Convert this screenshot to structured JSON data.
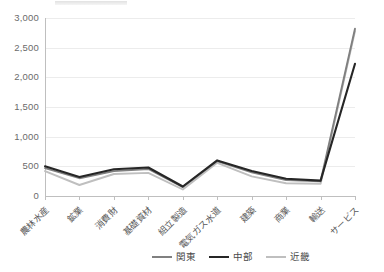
{
  "chart_data": {
    "type": "line",
    "title": "",
    "xlabel": "",
    "ylabel": "",
    "ylim": [
      0,
      3000
    ],
    "ytick_labels": [
      "3,000",
      "2,500",
      "2,000",
      "1,500",
      "1,000",
      "500",
      "0"
    ],
    "ytick_values": [
      3000,
      2500,
      2000,
      1500,
      1000,
      500,
      0
    ],
    "grid": true,
    "legend_position": "bottom",
    "categories": [
      "農林水産",
      "鉱業",
      "消費財",
      "基礎資材",
      "組立製造",
      "電気ガス水道",
      "建築",
      "商業",
      "輸送",
      "サービス"
    ],
    "series": [
      {
        "name": "関東",
        "color": "#808080",
        "values": [
          470,
          300,
          420,
          455,
          150,
          590,
          400,
          270,
          250,
          2820
        ]
      },
      {
        "name": "中部",
        "color": "#262626",
        "values": [
          500,
          320,
          450,
          480,
          160,
          600,
          420,
          290,
          260,
          2230
        ]
      },
      {
        "name": "近畿",
        "color": "#bfbfbf",
        "values": [
          420,
          185,
          370,
          390,
          110,
          560,
          330,
          215,
          205,
          2780
        ]
      }
    ]
  },
  "legend": {
    "items": [
      {
        "label": "関東",
        "color": "#808080"
      },
      {
        "label": "中部",
        "color": "#262626"
      },
      {
        "label": "近畿",
        "color": "#bfbfbf"
      }
    ]
  }
}
